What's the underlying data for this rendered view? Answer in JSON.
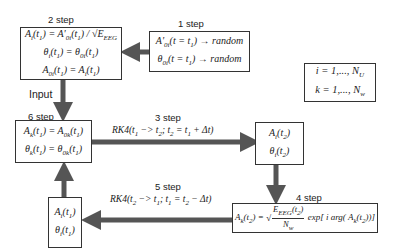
{
  "labels": {
    "step1": "1 step",
    "step2": "2 step",
    "step3": "3 step",
    "step4": "4 step",
    "step5": "5 step",
    "step6": "6 step",
    "input": "Input"
  },
  "boxes": {
    "step1": {
      "lines": [
        "A'₀ᵢ(t = t₁) → random",
        "θ₀ᵢ(t = t₁) → random"
      ]
    },
    "step2": {
      "lines": [
        "Aᵢ(t₁) = A'₀ᵢ(t₁) / √E_EEG",
        "θᵢ(t₁) = θ₀ᵢ(t₁)",
        "A₀ᵢ(t₁) = Aᵢ(t₁)"
      ]
    },
    "indices": {
      "lines": [
        "i = 1,..., N_U",
        "k = 1,..., N_w"
      ]
    },
    "step6": {
      "lines": [
        "A_k(t₁) = A_0k(t₁)",
        "θ_k(t₁) = θ_0k(t₁)"
      ]
    },
    "t2_state": {
      "lines": [
        "Aᵢ(t₂)",
        "θᵢ(t₂)"
      ]
    },
    "step4": {
      "lines": [
        "A_k(t₂) = √(E_EEG(t₂)/N_w) exp[i arg(A_k(t₂))]"
      ]
    },
    "t1_state": {
      "lines": [
        "Aᵢ(t₁)",
        "θᵢ(t₁)"
      ]
    }
  },
  "arrows": {
    "step3_eq": "RK4(t₁ −> t₂; t₂ = t₁ + Δt)",
    "step5_eq": "RK4(t₂ −> t₁; t₁ = t₂ − Δt)"
  },
  "colors": {
    "arrow": "#555555",
    "border": "#333333"
  }
}
